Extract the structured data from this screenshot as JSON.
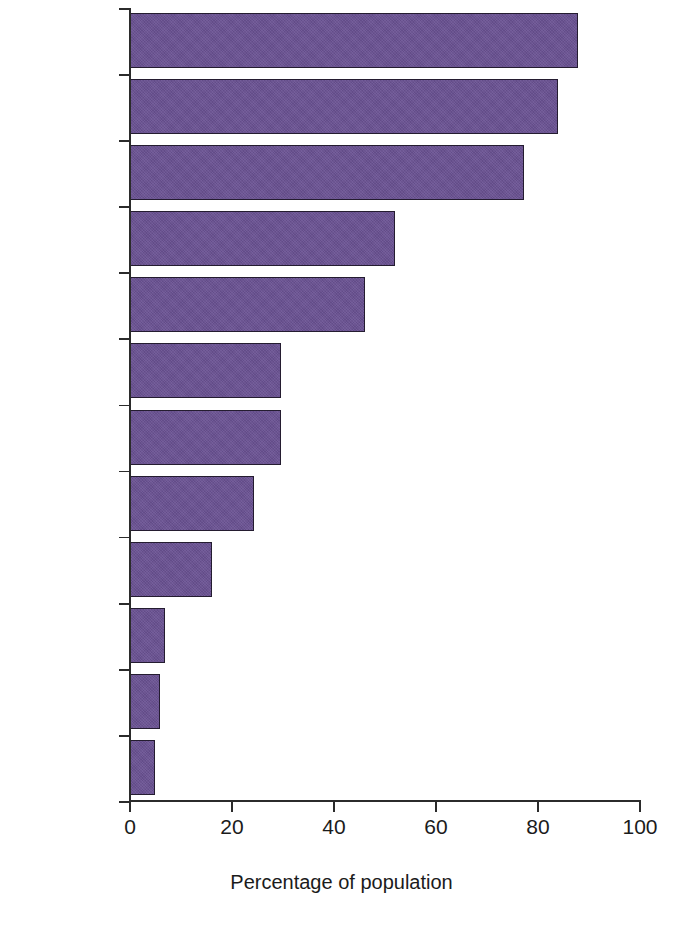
{
  "chart_data": {
    "type": "bar",
    "orientation": "horizontal",
    "title": "",
    "subtitle": "",
    "xlabel": "Percentage of population",
    "ylabel": "",
    "xlim": [
      0,
      100
    ],
    "xticks": [
      0,
      20,
      40,
      60,
      80,
      100
    ],
    "xtick_labels": [
      "0",
      "20",
      "40",
      "60",
      "80",
      "100"
    ],
    "grid": false,
    "legend": null,
    "categories": [
      "Burundi",
      "Liberia",
      "Madagascar",
      "India",
      "Ethiopia",
      "Indonesia",
      "Pakistan",
      "Vietnam",
      "China",
      "Estonia",
      "Brazil",
      "Argentina"
    ],
    "values": [
      87.8,
      83.9,
      77.3,
      52.0,
      46.0,
      29.6,
      29.6,
      24.3,
      16.1,
      6.9,
      5.9,
      4.9
    ],
    "series": [
      {
        "name": "Percentage of population",
        "values": [
          87.8,
          83.9,
          77.3,
          52.0,
          46.0,
          29.6,
          29.6,
          24.3,
          16.1,
          6.9,
          5.9,
          4.9
        ]
      }
    ],
    "colors": {
      "bar_fill": "#6a5293",
      "bar_edge": "#241c30",
      "axis": "#2b2b2b",
      "text": "#1b1b1b",
      "background": "#ffffff"
    }
  }
}
